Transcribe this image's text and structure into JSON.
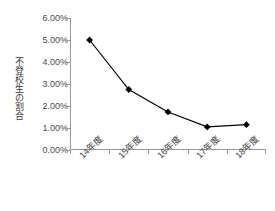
{
  "chart_data": {
    "type": "line",
    "title": "",
    "xlabel": "",
    "ylabel": "不登校生の割合",
    "categories": [
      "14年度",
      "15年度",
      "16年度",
      "17年度",
      "18年度"
    ],
    "values": [
      5.0,
      2.75,
      1.73,
      1.05,
      1.15
    ],
    "value_unit": "%",
    "ylim": [
      0.0,
      6.0
    ],
    "ytick_labels": [
      "6.00%",
      "5.00%",
      "4.00%",
      "3.00%",
      "2.00%",
      "1.00%",
      "0.00%"
    ],
    "ytick_values": [
      6.0,
      5.0,
      4.0,
      3.0,
      2.0,
      1.0,
      0.0
    ],
    "grid": false,
    "legend": false,
    "legend_position": "none",
    "series": [
      {
        "name": "不登校生の割合",
        "values": [
          5.0,
          2.75,
          1.73,
          1.05,
          1.15
        ],
        "line_color": "#000000",
        "marker": "diamond",
        "marker_color": "#000000"
      }
    ],
    "colors": {
      "line": "#000000",
      "marker": "#000000",
      "axis": "#9a9a9a",
      "tick_label": "#4a4a4a",
      "axis_title": "#3a3a3a",
      "background": "#ffffff"
    },
    "x_label_rotation_deg": -45
  }
}
